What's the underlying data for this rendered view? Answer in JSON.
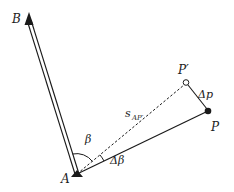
{
  "diagram": {
    "colors": {
      "ink": "#1a1a1a",
      "background": "#ffffff"
    },
    "points": {
      "A": {
        "label": "A",
        "marker": "filled-triangle"
      },
      "B": {
        "label": "B",
        "marker": "filled-arrowhead"
      },
      "P": {
        "label": "P",
        "marker": "filled-circle"
      },
      "P_prime": {
        "label": "P′",
        "marker": "open-circle"
      }
    },
    "segments": {
      "AB": {
        "style": "double-line"
      },
      "AP": {
        "style": "solid"
      },
      "AP_prime": {
        "style": "dashed",
        "label_main": "s",
        "label_sub": "AP′"
      },
      "PP_prime": {
        "style": "solid",
        "label": "Δp"
      }
    },
    "angles": {
      "beta": {
        "label": "β"
      },
      "delta_beta": {
        "label": "Δβ"
      }
    }
  }
}
